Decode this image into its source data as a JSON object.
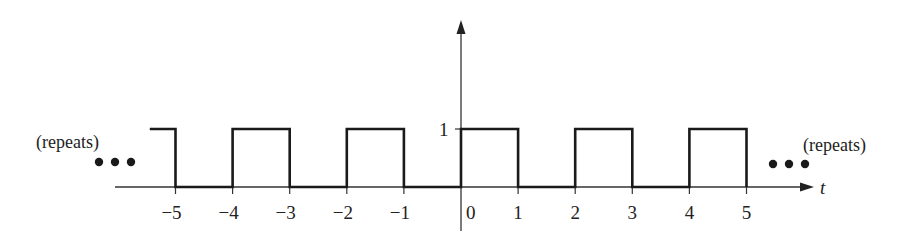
{
  "chart_data": {
    "type": "line",
    "title": "",
    "xlabel": "t",
    "ylabel": "",
    "xlim": [
      -5.5,
      6.2
    ],
    "ylim": [
      0,
      1
    ],
    "grid": false,
    "x_ticks": [
      -5,
      -4,
      -3,
      -2,
      -1,
      0,
      1,
      2,
      3,
      4,
      5
    ],
    "x_tick_labels": [
      "−5",
      "−4",
      "−3",
      "−2",
      "−1",
      "0",
      "1",
      "2",
      "3",
      "4",
      "5"
    ],
    "y_ticks": [
      1
    ],
    "y_tick_labels": [
      "1"
    ],
    "series": [
      {
        "name": "x(t)",
        "x": [
          -5.45,
          -5,
          -5,
          -4,
          -4,
          -3,
          -3,
          -2,
          -2,
          -1,
          -1,
          0,
          0,
          1,
          1,
          2,
          2,
          3,
          3,
          4,
          4,
          5,
          5
        ],
        "y": [
          1,
          1,
          0,
          0,
          1,
          1,
          0,
          0,
          1,
          1,
          0,
          0,
          1,
          1,
          0,
          0,
          1,
          1,
          0,
          0,
          1,
          1,
          0
        ]
      }
    ],
    "annotations": [
      {
        "text": "(repeats)",
        "position": "left"
      },
      {
        "text": "•••",
        "position": "left"
      },
      {
        "text": "(repeats)",
        "position": "right"
      },
      {
        "text": "•••",
        "position": "right"
      }
    ]
  },
  "labels": {
    "left_repeats": "(repeats)",
    "right_repeats": "(repeats)",
    "x_axis_name": "t",
    "y_tick_one": "1",
    "ticks": [
      "−5",
      "−4",
      "−3",
      "−2",
      "−1",
      "0",
      "1",
      "2",
      "3",
      "4",
      "5"
    ]
  },
  "colors": {
    "ink": "#222222",
    "background": "#ffffff"
  }
}
